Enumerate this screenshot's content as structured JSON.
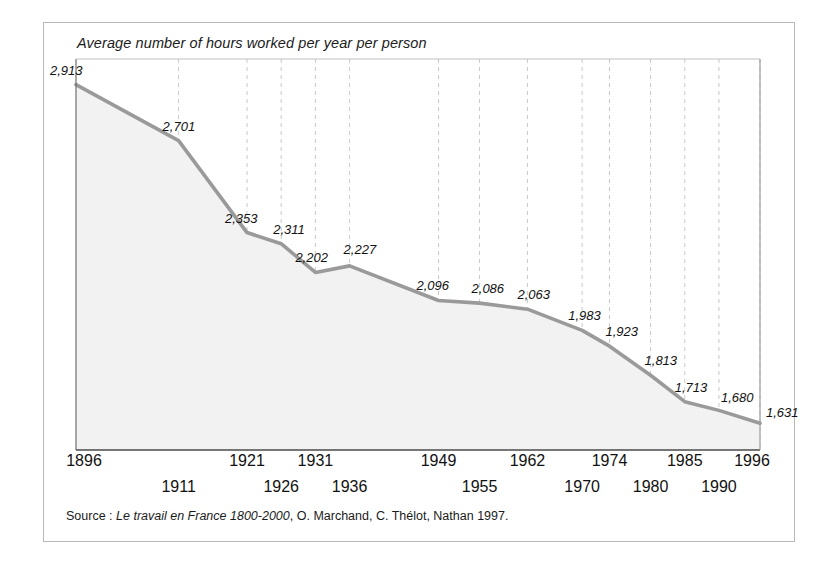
{
  "chart_data": {
    "type": "area",
    "title": "Average number of hours worked per year per person",
    "xlabel": "",
    "ylabel": "",
    "categories": [
      "1896",
      "1911",
      "1921",
      "1926",
      "1931",
      "1936",
      "1949",
      "1955",
      "1962",
      "1970",
      "1974",
      "1980",
      "1985",
      "1990",
      "1996"
    ],
    "values": [
      2913,
      2701,
      2353,
      2311,
      2202,
      2227,
      2096,
      2086,
      2063,
      1983,
      1923,
      1813,
      1713,
      1680,
      1631
    ],
    "value_labels": [
      "2,913",
      "2,701",
      "2,353",
      "2,311",
      "2,202",
      "2,227",
      "2,096",
      "2,086",
      "2,063",
      "1,983",
      "1,923",
      "1,813",
      "1,713",
      "1,680",
      "1,631"
    ],
    "ylim": [
      1530,
      3010
    ],
    "grid": true,
    "grid_axis": "x",
    "legend": "none",
    "line_color": "#9a9a9a",
    "fill_color": "#f2f2f2",
    "grid_color": "#c9c9c9",
    "axis_color": "#4a4a4a"
  },
  "source": {
    "prefix": "Source : ",
    "work_title": "Le travail en France 1800-2000",
    "suffix": ", O. Marchand, C. Thélot, Nathan 1997."
  },
  "axis_rows": {
    "top_indices": [
      0,
      2,
      4,
      6,
      8,
      10,
      12,
      14
    ],
    "bottom_indices": [
      1,
      3,
      5,
      7,
      9,
      11,
      13
    ]
  }
}
